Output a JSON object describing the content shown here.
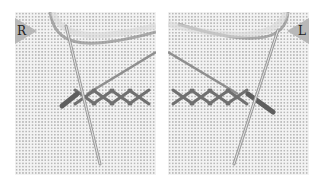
{
  "figure": {
    "panels": [
      {
        "id": "left",
        "label": "R",
        "label_side": "top-left",
        "description": "right-handed herringbone stitch with needle"
      },
      {
        "id": "right",
        "label": "L",
        "label_side": "top-right",
        "description": "left-handed herringbone stitch with needle"
      }
    ],
    "colors": {
      "fabric": "#f3f3f3",
      "grid_dots": "#b9b9b9",
      "label_tag": "#b8b8b8",
      "thread": "#6e6e6e",
      "needle": "#8a8a8a"
    }
  }
}
